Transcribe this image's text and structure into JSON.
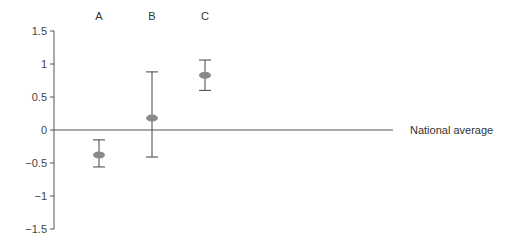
{
  "chart_data": {
    "type": "scatter",
    "title": "",
    "xlabel": "",
    "ylabel": "",
    "categories": [
      "A",
      "B",
      "C"
    ],
    "series": [
      {
        "name": "estimate",
        "values": [
          -0.38,
          0.18,
          0.83
        ],
        "lower": [
          -0.56,
          -0.41,
          0.6
        ],
        "upper": [
          -0.15,
          0.88,
          1.06
        ]
      }
    ],
    "ylim": [
      -1.5,
      1.5
    ],
    "yticks": [
      1.5,
      1,
      0.5,
      0,
      -0.5,
      -1,
      -1.5
    ],
    "ytick_labels": [
      "1.5",
      "1",
      "0.5",
      "0",
      "−0.5",
      "−1",
      "−1.5"
    ],
    "reference_line": {
      "y": 0,
      "label": "National average"
    },
    "grid": false,
    "legend": null,
    "colors": {
      "marker": "#8a8a8a",
      "line": "#444444"
    }
  }
}
